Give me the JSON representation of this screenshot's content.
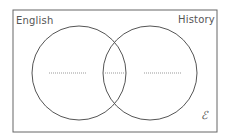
{
  "diagram": {
    "type": "venn",
    "sets": [
      {
        "label": "English",
        "center": [
          79,
          73
        ],
        "radius": 47
      },
      {
        "label": "History",
        "center": [
          150,
          73
        ],
        "radius": 47
      }
    ],
    "universal_symbol": "ℰ",
    "regions": {
      "english_only": {
        "blank": true,
        "line": [
          49,
          86
        ]
      },
      "both": {
        "blank": true,
        "line": [
          103,
          126
        ]
      },
      "history_only": {
        "blank": true,
        "line": [
          144,
          181
        ]
      }
    },
    "colors": {
      "stroke": "#555555",
      "dotted": "#999999",
      "background": "#ffffff"
    }
  }
}
